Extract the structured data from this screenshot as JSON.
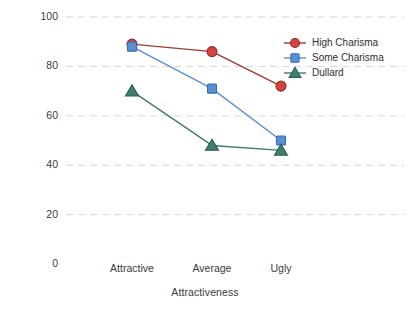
{
  "chart_data": {
    "type": "line",
    "title": "",
    "xlabel": "Attractiveness",
    "ylabel": "Mean Rating",
    "categories": [
      "Attractive",
      "Average",
      "Ugly"
    ],
    "ylim": [
      0,
      100
    ],
    "yticks": [
      0,
      20,
      40,
      60,
      80,
      100
    ],
    "ytick_labels": [
      "0",
      "20",
      "40",
      "60",
      "80",
      "100"
    ],
    "grid": "horizontal-dashed",
    "legend_position": "top-right-inside",
    "series": [
      {
        "name": "High Charisma",
        "values": [
          89,
          86,
          72
        ],
        "marker": "circle",
        "color": "#D2443C",
        "line_color": "#A03A2E",
        "edge_color": "#8A2F26"
      },
      {
        "name": "Some Charisma",
        "values": [
          88,
          71,
          50
        ],
        "marker": "square",
        "color": "#5B8FD4",
        "line_color": "#5B8FD4",
        "edge_color": "#3A6BB0"
      },
      {
        "name": "Dullard",
        "values": [
          70,
          48,
          46
        ],
        "marker": "triangle",
        "color": "#3E8070",
        "line_color": "#3E7A6E",
        "edge_color": "#2C5D52"
      }
    ]
  },
  "axes": {
    "ylabel_text": "Mean Rating",
    "xlabel_text": "Attractiveness"
  },
  "legend": {
    "entries": [
      {
        "label": "High Charisma"
      },
      {
        "label": "Some Charisma"
      },
      {
        "label": "Dullard"
      }
    ]
  },
  "colors": {
    "grid": "#d6d6d6",
    "background": "#ffffff",
    "text": "#333333"
  }
}
